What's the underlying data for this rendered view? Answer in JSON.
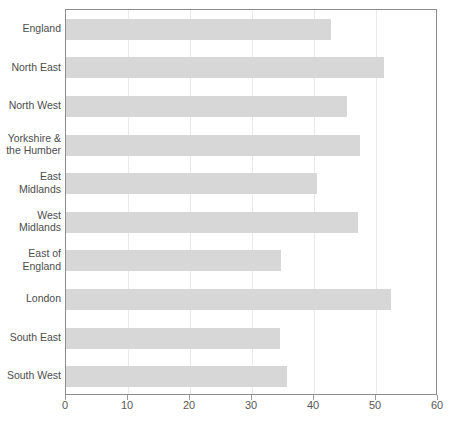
{
  "chart_data": {
    "type": "bar",
    "orientation": "horizontal",
    "title": "",
    "subtitle": "",
    "xlabel": "",
    "ylabel": "",
    "xlim": [
      0,
      60
    ],
    "xticks": [
      0,
      10,
      20,
      30,
      40,
      50,
      60
    ],
    "xtick_labels": [
      "0",
      "10",
      "20",
      "30",
      "40",
      "50",
      "60"
    ],
    "grid": true,
    "grid_axis": "x",
    "legend": false,
    "categories": [
      "England",
      "North East",
      "North West",
      "Yorkshire &\nthe Humber",
      "East\nMidlands",
      "West\nMidlands",
      "East of\nEngland",
      "London",
      "South East",
      "South West"
    ],
    "values": [
      42.8,
      51.3,
      45.3,
      47.4,
      40.5,
      47.1,
      34.7,
      52.4,
      34.5,
      35.7
    ],
    "bars": [
      {
        "label": "England",
        "value": 42.8
      },
      {
        "label": "North East",
        "value": 51.3
      },
      {
        "label": "North West",
        "value": 45.3
      },
      {
        "label": "Yorkshire &\nthe Humber",
        "value": 47.4
      },
      {
        "label": "East\nMidlands",
        "value": 40.5
      },
      {
        "label": "West\nMidlands",
        "value": 47.1
      },
      {
        "label": "East of\nEngland",
        "value": 34.7
      },
      {
        "label": "London",
        "value": 52.4
      },
      {
        "label": "South East",
        "value": 34.5
      },
      {
        "label": "South West",
        "value": 35.7
      }
    ]
  },
  "colors": {
    "bar_fill": "#d7d7d7",
    "gridline": "#e9e9e9",
    "plot_border": "#8d8d8d",
    "label_text": "#4d4d4d",
    "tick_text": "#585858",
    "background": "#ffffff"
  }
}
